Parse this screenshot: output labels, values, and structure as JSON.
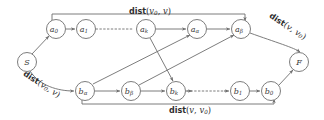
{
  "figure": {
    "name": "graph-diagram-dist",
    "background": "#ffffff",
    "stroke_color": "#6e6e6e",
    "text_color": "#2e2e2e"
  },
  "nodes": [
    {
      "id": "S",
      "base": "S",
      "sub": "",
      "x": 27,
      "y": 62,
      "r": 9.5
    },
    {
      "id": "a0",
      "base": "a",
      "sub": "0",
      "x": 56,
      "y": 29,
      "r": 9.5
    },
    {
      "id": "a1",
      "base": "a",
      "sub": "1",
      "x": 86,
      "y": 29,
      "r": 9.5
    },
    {
      "id": "ak",
      "base": "a",
      "sub": "k",
      "x": 146,
      "y": 29,
      "r": 9.5
    },
    {
      "id": "aalpha",
      "base": "a",
      "sub": "α",
      "x": 197,
      "y": 29,
      "r": 9.5
    },
    {
      "id": "abeta",
      "base": "a",
      "sub": "β",
      "x": 241,
      "y": 29,
      "r": 9.5
    },
    {
      "id": "balpha",
      "base": "b",
      "sub": "α",
      "x": 85,
      "y": 91,
      "r": 9.5
    },
    {
      "id": "bbeta",
      "base": "b",
      "sub": "β",
      "x": 131,
      "y": 91,
      "r": 9.5
    },
    {
      "id": "bk",
      "base": "b",
      "sub": "k",
      "x": 176,
      "y": 91,
      "r": 9.5
    },
    {
      "id": "b1",
      "base": "b",
      "sub": "1",
      "x": 240,
      "y": 91,
      "r": 9.5
    },
    {
      "id": "b0",
      "base": "b",
      "sub": "0",
      "x": 271,
      "y": 91,
      "r": 9.5
    },
    {
      "id": "F",
      "base": "F",
      "sub": "",
      "x": 299,
      "y": 62,
      "r": 9.5
    }
  ],
  "labels": {
    "top_dist": {
      "fn": "dist",
      "open": "(",
      "arg1": "v",
      "sub1": "0",
      "comma": ", ",
      "arg2": "v",
      "sub2": "",
      "close": ")",
      "x": 150,
      "y": 12,
      "rotate": 0
    },
    "bottom_dist": {
      "fn": "dist",
      "open": "(",
      "arg1": "v",
      "sub1": "",
      "comma": ", ",
      "arg2": "v",
      "sub2": "0",
      "close": ")",
      "x": 190,
      "y": 108,
      "rotate": 0
    },
    "left_dist": {
      "fn": "dist",
      "open": "(",
      "arg1": "v",
      "sub1": "0",
      "comma": ", ",
      "arg2": "v",
      "sub2": "",
      "close": ")",
      "x": 40,
      "y": 84,
      "rotate": 33
    },
    "right_dist": {
      "fn": "dist",
      "open": "(",
      "arg1": "v",
      "sub1": "",
      "comma": ", ",
      "arg2": "v",
      "sub2": "0",
      "close": ")",
      "x": 288,
      "y": 26,
      "rotate": 33
    }
  },
  "ellipses": [
    {
      "name": "ellipsis-top",
      "x1": 99,
      "x2": 134,
      "y": 29
    },
    {
      "name": "ellipsis-bottom",
      "x1": 189,
      "x2": 227,
      "y": 91
    }
  ],
  "edges": [
    {
      "name": "edge-s-a0",
      "from": "S",
      "to": "a0"
    },
    {
      "name": "edge-a0-a1",
      "from": "a0",
      "to": "a1"
    },
    {
      "name": "edge-ak-aalpha",
      "from": "ak",
      "to": "aalpha"
    },
    {
      "name": "edge-aalpha-abeta",
      "from": "aalpha",
      "to": "abeta"
    },
    {
      "name": "edge-s-balpha",
      "from": "S",
      "to": "balpha"
    },
    {
      "name": "edge-balpha-bbeta",
      "from": "balpha",
      "to": "bbeta"
    },
    {
      "name": "edge-bbeta-bk",
      "from": "bbeta",
      "to": "bk"
    },
    {
      "name": "edge-b1-b0",
      "from": "b1",
      "to": "b0"
    },
    {
      "name": "edge-b0-f",
      "from": "b0",
      "to": "F"
    },
    {
      "name": "edge-ak-bk",
      "from": "ak",
      "to": "bk"
    },
    {
      "name": "edge-balpha-aalpha",
      "from": "balpha",
      "to": "aalpha"
    },
    {
      "name": "edge-bbeta-abeta",
      "from": "bbeta",
      "to": "abeta"
    },
    {
      "name": "edge-a0-abeta-top",
      "from": "a0",
      "to": "abeta"
    },
    {
      "name": "edge-balpha-b0-bottom",
      "from": "balpha",
      "to": "b0"
    },
    {
      "name": "edge-abeta-f-curve",
      "from": "abeta",
      "to": "F"
    }
  ]
}
